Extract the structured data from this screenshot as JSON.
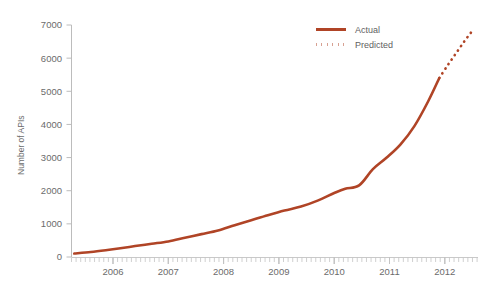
{
  "chart_data": {
    "type": "line",
    "title": "",
    "title_cropped_note": "Growth in Web APIs",
    "xlabel": "",
    "ylabel": "Number of APIs",
    "xlim": [
      2005.25,
      2012.6
    ],
    "ylim": [
      0,
      7000
    ],
    "yticks": [
      0,
      1000,
      2000,
      3000,
      4000,
      5000,
      6000,
      7000
    ],
    "ytick_labels": [
      "0",
      "1000",
      "2000",
      "3000",
      "4000",
      "5000",
      "6000",
      "7000"
    ],
    "xticks": [
      2006,
      2007,
      2008,
      2009,
      2010,
      2011,
      2012
    ],
    "xtick_labels": [
      "2006",
      "2007",
      "2008",
      "2009",
      "2010",
      "2011",
      "2012"
    ],
    "minor_xticks": "monthly",
    "grid": false,
    "legend_position": "top-right",
    "series": [
      {
        "name": "Actual",
        "style": "solid",
        "color": "#b04426",
        "x": [
          2005.3,
          2005.6,
          2005.9,
          2006.1,
          2006.4,
          2006.7,
          2007.0,
          2007.3,
          2007.6,
          2007.9,
          2008.2,
          2008.5,
          2008.8,
          2009.1,
          2009.4,
          2009.7,
          2010.0,
          2010.2,
          2010.45,
          2010.7,
          2010.95,
          2011.2,
          2011.45,
          2011.7,
          2011.9
        ],
        "values": [
          105,
          150,
          210,
          255,
          330,
          400,
          470,
          580,
          690,
          800,
          960,
          1110,
          1260,
          1400,
          1520,
          1700,
          1930,
          2060,
          2160,
          2650,
          3000,
          3400,
          3950,
          4700,
          5400
        ]
      },
      {
        "name": "Predicted",
        "style": "dotted",
        "color": "#b04426",
        "x": [
          2011.9,
          2012.05,
          2012.2,
          2012.35,
          2012.5
        ],
        "values": [
          5400,
          5780,
          6140,
          6500,
          6830
        ]
      }
    ]
  },
  "legend": {
    "items": [
      {
        "label": "Actual",
        "style": "solid"
      },
      {
        "label": "Predicted",
        "style": "dotted"
      }
    ]
  },
  "axes": {
    "y_title": "Number of APIs"
  },
  "colors": {
    "series": "#b04426",
    "axis": "#b9b9b9",
    "tick_text": "#6b6b6b"
  }
}
